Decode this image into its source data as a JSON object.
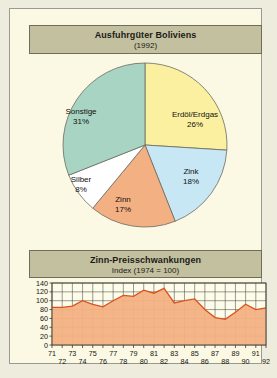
{
  "page": {
    "background_color": "#eeecdc",
    "plate_color": "#fbf8e4",
    "plaque_color": "#c3c0a0"
  },
  "pie_panel": {
    "title": "Ausfuhrgüter Boliviens",
    "subtitle": "(1992)"
  },
  "line_panel": {
    "title": "Zinn-Preisschwankungen",
    "subtitle": "Index (1974 = 100)"
  },
  "chart_data": [
    {
      "type": "pie",
      "title": "Ausfuhrgüter Boliviens",
      "subtitle": "(1992)",
      "unit": "%",
      "legend": "none",
      "labels": [
        "Erdöl/Erdgas",
        "Zink",
        "Zinn",
        "Silber",
        "Sonstige"
      ],
      "values": [
        26,
        18,
        17,
        8,
        31
      ],
      "colors": [
        "#faf0a0",
        "#c8e7f4",
        "#f3b183",
        "#ffffff",
        "#a8d4c4"
      ],
      "slices": [
        {
          "label": "Erdöl/Erdgas",
          "value": 26,
          "value_text": "26%",
          "color": "#faf0a0"
        },
        {
          "label": "Zink",
          "value": 18,
          "value_text": "18%",
          "color": "#c8e7f4"
        },
        {
          "label": "Zinn",
          "value": 17,
          "value_text": "17%",
          "color": "#f3b183"
        },
        {
          "label": "Silber",
          "value": 8,
          "value_text": "8%",
          "color": "#ffffff"
        },
        {
          "label": "Sonstige",
          "value": 31,
          "value_text": "31%",
          "color": "#a8d4c4"
        }
      ]
    },
    {
      "type": "area",
      "title": "Zinn-Preisschwankungen",
      "subtitle": "Index (1974 = 100)",
      "xlabel": "",
      "ylabel": "",
      "ylim": [
        0,
        140
      ],
      "yticks": [
        0,
        20,
        40,
        60,
        80,
        100,
        120,
        140
      ],
      "grid": true,
      "line_color": "#d9531e",
      "fill_color": "#f3b183",
      "x": [
        71,
        72,
        73,
        74,
        75,
        76,
        77,
        78,
        79,
        80,
        81,
        82,
        83,
        84,
        85,
        86,
        87,
        88,
        89,
        90,
        91,
        92
      ],
      "xticklabels_top": [
        "71",
        "73",
        "75",
        "77",
        "79",
        "81",
        "83",
        "85",
        "87",
        "89",
        "91"
      ],
      "xticklabels_bottom": [
        "72",
        "74",
        "76",
        "78",
        "80",
        "82",
        "84",
        "86",
        "88",
        "90",
        "92"
      ],
      "values": [
        85,
        85,
        88,
        100,
        92,
        86,
        100,
        112,
        110,
        124,
        117,
        128,
        95,
        100,
        104,
        80,
        62,
        58,
        74,
        92,
        80,
        84
      ]
    }
  ]
}
